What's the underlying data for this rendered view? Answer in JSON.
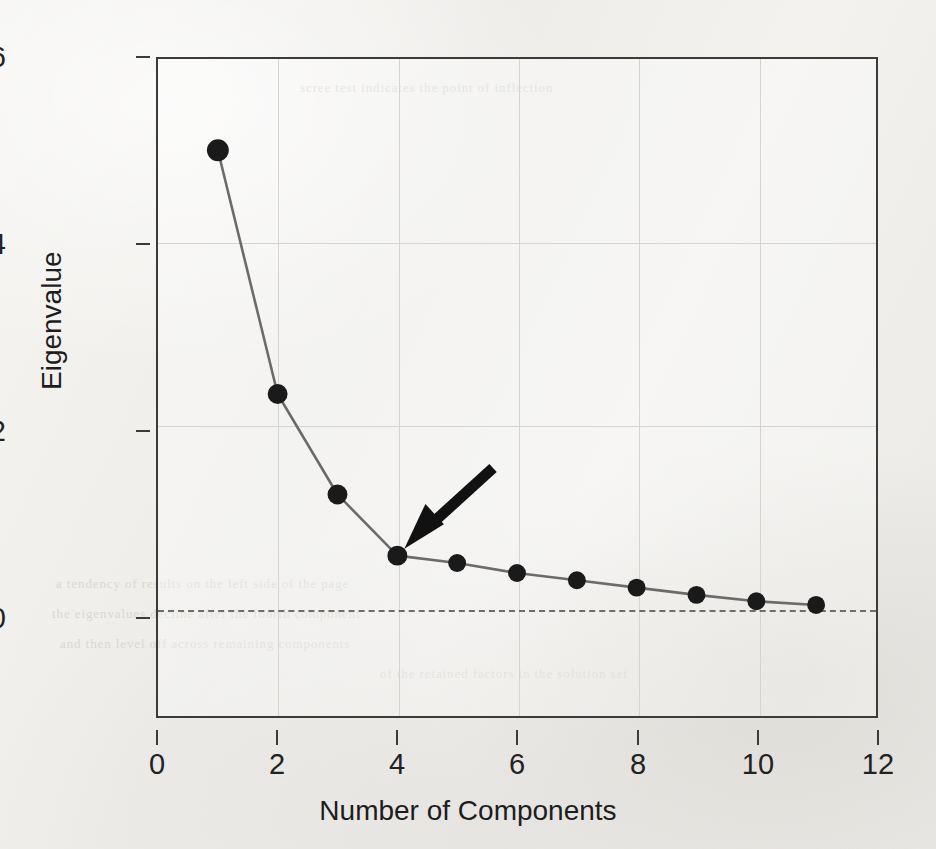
{
  "chart_data": {
    "type": "line",
    "title": "",
    "xlabel": "Number of Components",
    "ylabel": "Eigenvalue",
    "x": [
      1,
      2,
      3,
      4,
      5,
      6,
      7,
      8,
      9,
      10,
      11
    ],
    "values": [
      5.0,
      2.33,
      1.23,
      0.56,
      0.48,
      0.37,
      0.29,
      0.21,
      0.13,
      0.06,
      0.02
    ],
    "series": [
      {
        "name": "Eigenvalue",
        "values": [
          5.0,
          2.33,
          1.23,
          0.56,
          0.48,
          0.37,
          0.29,
          0.21,
          0.13,
          0.06,
          0.02
        ]
      }
    ],
    "xlim": [
      0,
      12
    ],
    "ylim": [
      -1.2,
      6
    ],
    "xticks": [
      "0",
      "2",
      "4",
      "6",
      "8",
      "10",
      "12"
    ],
    "xtick_values": [
      0,
      2,
      4,
      6,
      8,
      10,
      12
    ],
    "yticks": [
      "6",
      "4",
      "2",
      "0"
    ],
    "ytick_values": [
      6,
      4,
      2,
      0
    ],
    "gridlines_x": [
      2,
      4,
      6,
      8,
      10
    ],
    "gridlines_y": [
      4,
      2
    ],
    "grid": true,
    "legend": "none",
    "marker": "filled-circle",
    "line_color": "#6b6b6b",
    "marker_color": "#1a1a1a",
    "reference_line": {
      "axis": "y",
      "value": 0,
      "style": "dashed",
      "color": "#6f6d6a"
    },
    "annotations": [
      {
        "type": "arrow",
        "label": "elbow-arrow",
        "points_to_x": 4,
        "points_to_y": 0.56,
        "tail_x": 5.6,
        "tail_y": 1.52,
        "color": "#111111"
      }
    ]
  },
  "axes": {
    "y_title": "Eigenvalue",
    "x_title": "Number of Components",
    "y_tick_labels": [
      "6",
      "4",
      "2",
      "0"
    ],
    "x_tick_labels": [
      "0",
      "2",
      "4",
      "6",
      "8",
      "10",
      "12"
    ]
  },
  "background": {
    "bleed_text": [
      "a tendency of results on the left side of the page",
      "the eigenvalues decline after the fourth component",
      "and then level off across remaining components",
      "of the retained factors in the solution set",
      "scree test indicates the point of inflection"
    ]
  },
  "colors": {
    "paper": "#f2f1ee",
    "frame": "#3b3b3b",
    "grid": "#d6d4d0",
    "line": "#6b6b6b",
    "marker": "#1a1a1a",
    "arrow": "#111111",
    "text": "#1d1d1d"
  }
}
